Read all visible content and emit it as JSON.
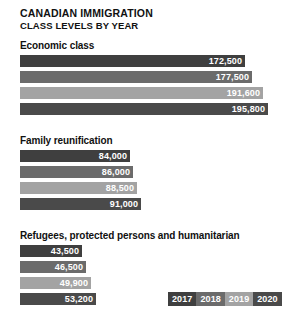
{
  "chart_data": {
    "type": "bar",
    "orientation": "horizontal",
    "title": "CANADIAN IMMIGRATION",
    "subtitle": "CLASS LEVELS BY YEAR",
    "xlabel": "",
    "ylabel": "",
    "grid": false,
    "legend_position": "bottom-right",
    "categories": [
      "Economic class",
      "Family reunification",
      "Refugees, protected persons and humanitarian"
    ],
    "series": [
      {
        "name": "2017",
        "color": "#3f3f3f",
        "values": [
          172500,
          84000,
          43500
        ],
        "labels": [
          "172,500",
          "84,000",
          "43,500"
        ]
      },
      {
        "name": "2018",
        "color": "#6b6b6b",
        "values": [
          177500,
          86000,
          46500
        ],
        "labels": [
          "177,500",
          "86,000",
          "46,500"
        ]
      },
      {
        "name": "2019",
        "color": "#a3a3a3",
        "values": [
          191600,
          88500,
          49900
        ],
        "labels": [
          "191,600",
          "88,500",
          "49,900"
        ]
      },
      {
        "name": "2020",
        "color": "#4a4a4a",
        "values": [
          195800,
          91000,
          53200
        ],
        "labels": [
          "195,800",
          "91,000",
          "53,200"
        ]
      }
    ],
    "xlim": [
      0,
      195800
    ],
    "groups": [
      {
        "label": "Economic class",
        "bars": [
          {
            "year": "2017",
            "value": 172500,
            "label": "172,500",
            "color": "#3f3f3f",
            "width_px": 225
          },
          {
            "year": "2018",
            "value": 177500,
            "label": "177,500",
            "color": "#6b6b6b",
            "width_px": 232
          },
          {
            "year": "2019",
            "value": 191600,
            "label": "191,600",
            "color": "#a3a3a3",
            "width_px": 243
          },
          {
            "year": "2020",
            "value": 195800,
            "label": "195,800",
            "color": "#4a4a4a",
            "width_px": 248
          }
        ]
      },
      {
        "label": "Family reunification",
        "bars": [
          {
            "year": "2017",
            "value": 84000,
            "label": "84,000",
            "color": "#3f3f3f",
            "width_px": 110
          },
          {
            "year": "2018",
            "value": 86000,
            "label": "86,000",
            "color": "#6b6b6b",
            "width_px": 113
          },
          {
            "year": "2019",
            "value": 88500,
            "label": "88,500",
            "color": "#a3a3a3",
            "width_px": 117
          },
          {
            "year": "2020",
            "value": 91000,
            "label": "91,000",
            "color": "#4a4a4a",
            "width_px": 121
          }
        ]
      },
      {
        "label": "Refugees, protected persons and humanitarian",
        "bars": [
          {
            "year": "2017",
            "value": 43500,
            "label": "43,500",
            "color": "#3f3f3f",
            "width_px": 62
          },
          {
            "year": "2018",
            "value": 46500,
            "label": "46,500",
            "color": "#6b6b6b",
            "width_px": 66
          },
          {
            "year": "2019",
            "value": 49900,
            "label": "49,900",
            "color": "#a3a3a3",
            "width_px": 71
          },
          {
            "year": "2020",
            "value": 53200,
            "label": "53,200",
            "color": "#4a4a4a",
            "width_px": 76
          }
        ]
      }
    ],
    "legend": [
      {
        "label": "2017",
        "color": "#3f3f3f"
      },
      {
        "label": "2018",
        "color": "#6b6b6b"
      },
      {
        "label": "2019",
        "color": "#a3a3a3"
      },
      {
        "label": "2020",
        "color": "#4a4a4a"
      }
    ]
  }
}
